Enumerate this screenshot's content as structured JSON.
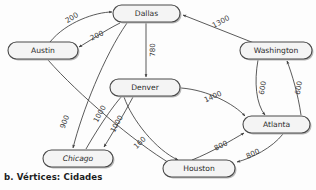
{
  "diagram": {
    "caption": "b.  Vértices: Cidades",
    "colors": {
      "node_fill": "#f4f4f4",
      "node_stroke": "#4a4a4a",
      "edge_stroke": "#3c3c3c",
      "label_text": "#2b2b2b",
      "background": "#fdfdfd"
    },
    "nodes": [
      {
        "id": "dallas",
        "label": "Dallas",
        "x": 146.5,
        "y": 13.5,
        "w": 67,
        "h": 17,
        "italic": false
      },
      {
        "id": "austin",
        "label": "Austin",
        "x": 43.0,
        "y": 50.5,
        "w": 70,
        "h": 17,
        "italic": false
      },
      {
        "id": "washington",
        "label": "Washington",
        "x": 276.0,
        "y": 50.5,
        "w": 72,
        "h": 17,
        "italic": false
      },
      {
        "id": "denver",
        "label": "Denver",
        "x": 145.0,
        "y": 87.5,
        "w": 70,
        "h": 17,
        "italic": false
      },
      {
        "id": "atlanta",
        "label": "Atlanta",
        "x": 276.5,
        "y": 124.5,
        "w": 67,
        "h": 17,
        "italic": false
      },
      {
        "id": "chicago",
        "label": "Chicago",
        "x": 78.0,
        "y": 158.5,
        "w": 70,
        "h": 17,
        "italic": true
      },
      {
        "id": "houston",
        "label": "Houston",
        "x": 199.0,
        "y": 168.5,
        "w": 72,
        "h": 17,
        "italic": false
      }
    ],
    "edges": [
      {
        "id": "austin-dallas",
        "from": "austin",
        "to": "dallas",
        "weight": "200",
        "lx": 72,
        "ly": 18,
        "rot": -32
      },
      {
        "id": "dallas-austin",
        "from": "dallas",
        "to": "austin",
        "weight": "200",
        "lx": 97,
        "ly": 36,
        "rot": -25
      },
      {
        "id": "dallas-denver",
        "from": "dallas",
        "to": "denver",
        "weight": "780",
        "lx": 153,
        "ly": 50,
        "rot": -90
      },
      {
        "id": "washington-dallas",
        "from": "washington",
        "to": "dallas",
        "weight": "1300",
        "lx": 221,
        "ly": 22,
        "rot": -28
      },
      {
        "id": "washington-atlanta",
        "from": "washington",
        "to": "atlanta",
        "weight": "600",
        "lx": 263,
        "ly": 88,
        "rot": -80
      },
      {
        "id": "atlanta-washington",
        "from": "atlanta",
        "to": "washington",
        "weight": "600",
        "lx": 299,
        "ly": 88,
        "rot": -80
      },
      {
        "id": "denver-atlanta",
        "from": "denver",
        "to": "atlanta",
        "weight": "1400",
        "lx": 213,
        "ly": 97,
        "rot": -24
      },
      {
        "id": "houston-atlanta",
        "from": "houston",
        "to": "atlanta",
        "weight": "800",
        "lx": 221,
        "ly": 146,
        "rot": -25
      },
      {
        "id": "atlanta-houston",
        "from": "atlanta",
        "to": "houston",
        "weight": "800",
        "lx": 253,
        "ly": 154,
        "rot": -25
      },
      {
        "id": "dallas-chicago",
        "from": "dallas",
        "to": "chicago",
        "weight": "900",
        "lx": 65,
        "ly": 122,
        "rot": -70
      },
      {
        "id": "chicago-denver",
        "from": "chicago",
        "to": "denver",
        "weight": "1000",
        "lx": 100,
        "ly": 114,
        "rot": -62
      },
      {
        "id": "denver-chicago",
        "from": "denver",
        "to": "chicago",
        "weight": "1000",
        "lx": 117,
        "ly": 124,
        "rot": -62
      },
      {
        "id": "denver-houston",
        "from": "denver",
        "to": "houston",
        "weight": "160",
        "lx": 140,
        "ly": 143,
        "rot": -44
      }
    ]
  }
}
